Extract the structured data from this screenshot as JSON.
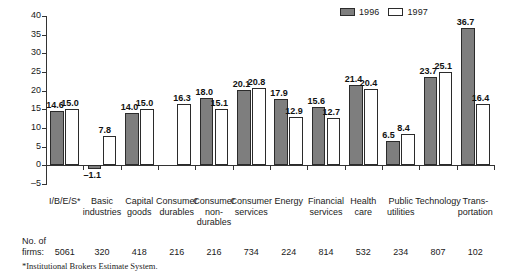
{
  "chart_data": {
    "type": "bar",
    "title": "",
    "subtitle": "",
    "xlabel": "",
    "ylabel": "",
    "ylim": [
      -5,
      40
    ],
    "ytick_step": 5,
    "yticks": [
      "40",
      "35",
      "30",
      "25",
      "20",
      "15",
      "10",
      "5",
      "0",
      "-5"
    ],
    "grid": false,
    "legend_position": "top-right",
    "categories": [
      "I/B/E/S*",
      "Basic\nindustries",
      "Capital\ngoods",
      "Consumer\ndurables",
      "Consumer\nnon-\ndurables",
      "Consumer\nservices",
      "Energy",
      "Financial\nservices",
      "Health\ncare",
      "Public\nutilities",
      "Technology",
      "Trans-\nportation"
    ],
    "series": [
      {
        "name": "1996",
        "color": "#7e7e7e",
        "values": [
          14.6,
          -1.1,
          14.0,
          null,
          18.0,
          20.1,
          17.9,
          15.6,
          21.4,
          6.5,
          23.7,
          36.7
        ],
        "labels": [
          "14.6",
          "-1.1",
          "14.0",
          "",
          "18.0",
          "20.1",
          "17.9",
          "15.6",
          "21.4",
          "6.5",
          "23.7",
          "36.7"
        ]
      },
      {
        "name": "1997",
        "color": "#ffffff",
        "values": [
          15.0,
          7.8,
          15.0,
          16.3,
          15.1,
          20.8,
          12.9,
          12.7,
          20.4,
          8.4,
          25.1,
          16.4
        ],
        "labels": [
          "15.0",
          "7.8",
          "15.0",
          "16.3",
          "15.1",
          "20.8",
          "12.9",
          "12.7",
          "20.4",
          "8.4",
          "25.1",
          "16.4"
        ]
      }
    ],
    "firm_counts": [
      "5061",
      "320",
      "418",
      "216",
      "216",
      "734",
      "224",
      "814",
      "532",
      "234",
      "807",
      "102"
    ],
    "firms_caption": "No. of\nfirms:",
    "footnote": "*Institutional Brokers Estimate System."
  },
  "legend": {
    "entries": [
      {
        "label": "1996",
        "color": "#7e7e7e"
      },
      {
        "label": "1997",
        "color": "#ffffff"
      }
    ]
  }
}
